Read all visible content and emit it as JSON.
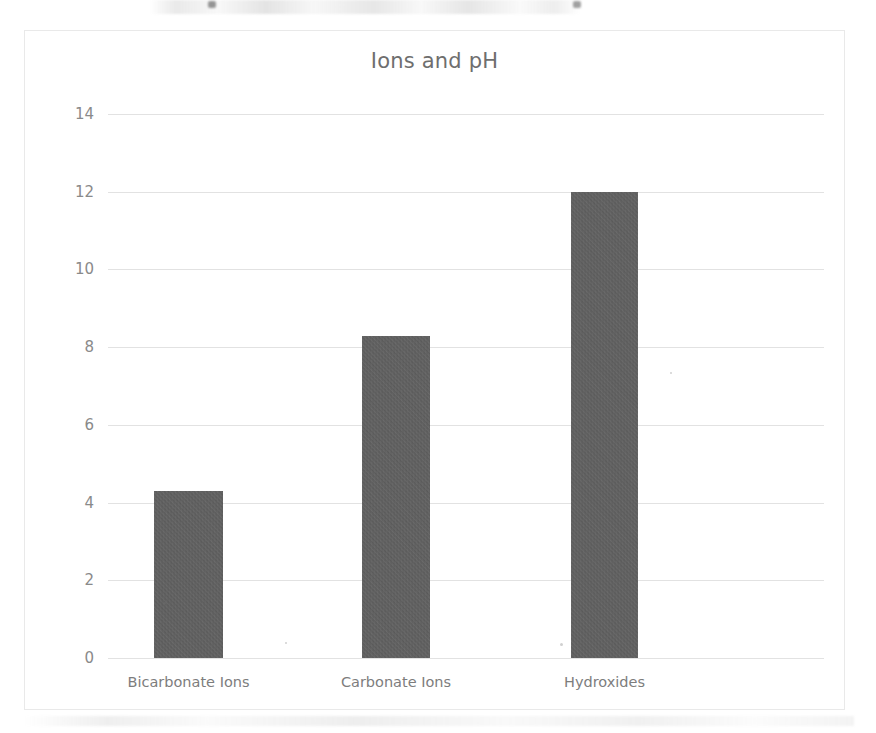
{
  "chart_data": {
    "type": "bar",
    "title": "Ions and pH",
    "categories": [
      "Bicarbonate Ions",
      "Carbonate Ions",
      "Hydroxides"
    ],
    "values": [
      4.3,
      8.3,
      12.0
    ],
    "xlabel": "",
    "ylabel": "",
    "ylim": [
      0,
      14
    ],
    "ytick_labels": [
      "0",
      "2",
      "4",
      "6",
      "8",
      "10",
      "12",
      "14"
    ],
    "ytick_values": [
      0,
      2,
      4,
      6,
      8,
      10,
      12,
      14
    ],
    "grid": true,
    "legend": false,
    "series": [
      {
        "name": "pH",
        "values": [
          4.3,
          8.3,
          12.0
        ]
      }
    ]
  },
  "colors": {
    "bar": "#5e5e5e",
    "gridline": "#e2e2e2",
    "title_text": "#6e6e6e",
    "tick_text": "#8a8a8a",
    "category_text": "#7d7d7d",
    "frame_border": "#e9e9e9",
    "background": "#ffffff"
  }
}
